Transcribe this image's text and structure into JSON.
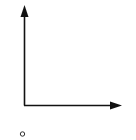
{
  "diagram": {
    "type": "coordinate-axes",
    "stroke_color": "#111111",
    "background": "#ffffff",
    "y_axis": {
      "label": "",
      "direction": "up"
    },
    "x_axis": {
      "label": "",
      "direction": "right"
    },
    "marker": {
      "shape": "open-circle",
      "label": ""
    }
  }
}
